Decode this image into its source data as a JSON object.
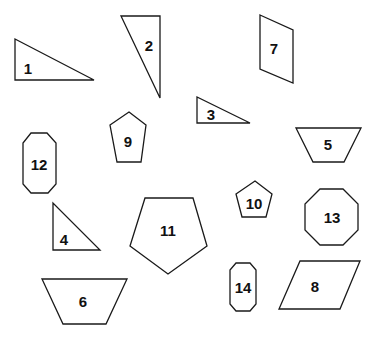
{
  "diagram": {
    "stroke_color": "#1a1a1a",
    "fill_color": "#ffffff",
    "shapes": [
      {
        "id": "1",
        "label": "1",
        "kind": "right-triangle",
        "points": "15,39 15,80 94,80",
        "lx": 28,
        "ly": 68
      },
      {
        "id": "2",
        "label": "2",
        "kind": "right-triangle",
        "points": "121,16 160,16 160,98",
        "lx": 149,
        "ly": 45
      },
      {
        "id": "3",
        "label": "3",
        "kind": "right-triangle",
        "points": "197,97 197,123 250,123",
        "lx": 211,
        "ly": 114
      },
      {
        "id": "4",
        "label": "4",
        "kind": "right-triangle",
        "points": "53,203 53,250 100,250",
        "lx": 64,
        "ly": 239
      },
      {
        "id": "5",
        "label": "5",
        "kind": "trapezoid",
        "points": "296,128 361,128 344,162 313,162",
        "lx": 328,
        "ly": 144
      },
      {
        "id": "6",
        "label": "6",
        "kind": "trapezoid",
        "points": "42,279 127,279 106,324 63,324",
        "lx": 83,
        "ly": 301
      },
      {
        "id": "7",
        "label": "7",
        "kind": "parallelogram",
        "points": "260,15 293,30 293,83 260,69",
        "lx": 274,
        "ly": 48
      },
      {
        "id": "8",
        "label": "8",
        "kind": "parallelogram",
        "points": "300,261 360,261 340,309 279,309",
        "lx": 315,
        "ly": 286
      },
      {
        "id": "9",
        "label": "9",
        "kind": "pentagon",
        "points": "129,112 146,125 141,162 117,162 110,125",
        "lx": 128,
        "ly": 141
      },
      {
        "id": "10",
        "label": "10",
        "kind": "pentagon",
        "points": "255,181 272,194 266,217 242,217 236,194",
        "lx": 254,
        "ly": 203
      },
      {
        "id": "11",
        "label": "11",
        "kind": "pentagon",
        "points": "145,198 193,198 207,246 168,274 130,246",
        "lx": 168,
        "ly": 230
      },
      {
        "id": "12",
        "label": "12",
        "kind": "octagon",
        "points": "31,133 47,133 56,143 56,184 48,193 31,193 23,184 23,143",
        "lx": 39,
        "ly": 164
      },
      {
        "id": "13",
        "label": "13",
        "kind": "octagon",
        "points": "320,189 343,189 358,204 358,230 343,245 320,245 305,230 305,204",
        "lx": 332,
        "ly": 217
      },
      {
        "id": "14",
        "label": "14",
        "kind": "octagon",
        "points": "236,263 250,263 256,270 256,304 250,311 236,311 230,304 230,270",
        "lx": 243,
        "ly": 287
      }
    ]
  }
}
